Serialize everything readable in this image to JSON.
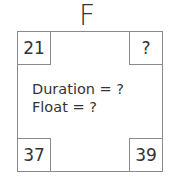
{
  "node": {
    "label": "F",
    "early_start": "21",
    "early_finish": "?",
    "late_start": "37",
    "late_finish": "39",
    "duration_text": "Duration = ?",
    "float_text": "Float = ?"
  }
}
